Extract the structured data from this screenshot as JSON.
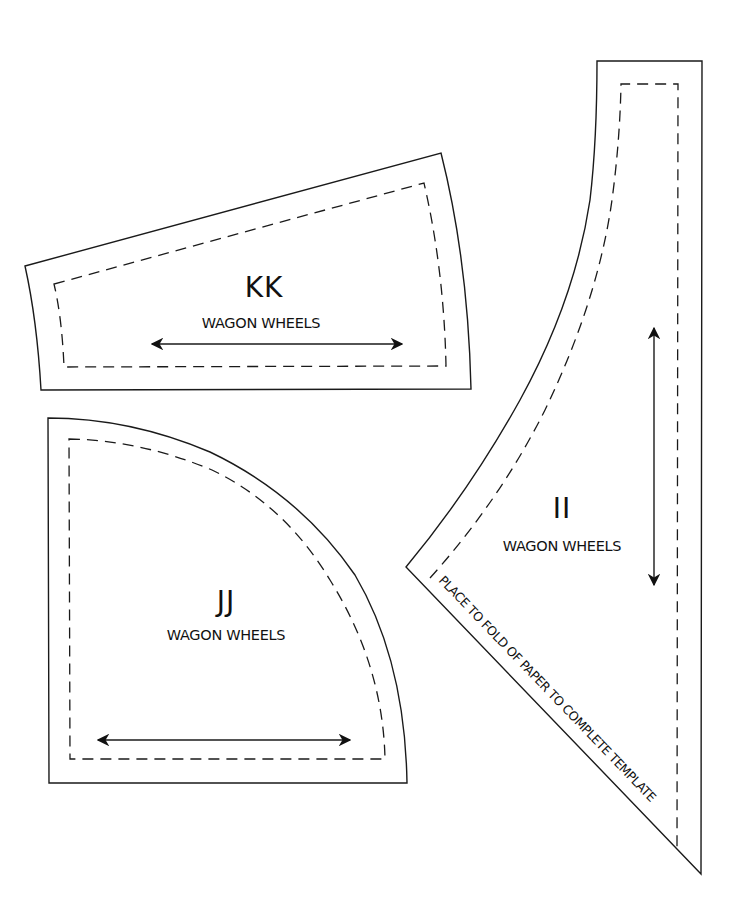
{
  "sheet": {
    "background": "#ffffff",
    "line_color": "#1a1a1a"
  },
  "pieces": [
    {
      "id": "KK",
      "name": "WAGON WHEELS",
      "shape": "curved trapezoid",
      "grainline": "horizontal double arrow"
    },
    {
      "id": "JJ",
      "name": "WAGON WHEELS",
      "shape": "quarter circle",
      "grainline": "horizontal double arrow"
    },
    {
      "id": "II",
      "name": "WAGON WHEELS",
      "shape": "curved wedge (half template)",
      "grainline": "vertical double arrow",
      "fold_instruction": "PLACE TO FOLD OF PAPER TO COMPLETE TEMPLATE"
    }
  ]
}
